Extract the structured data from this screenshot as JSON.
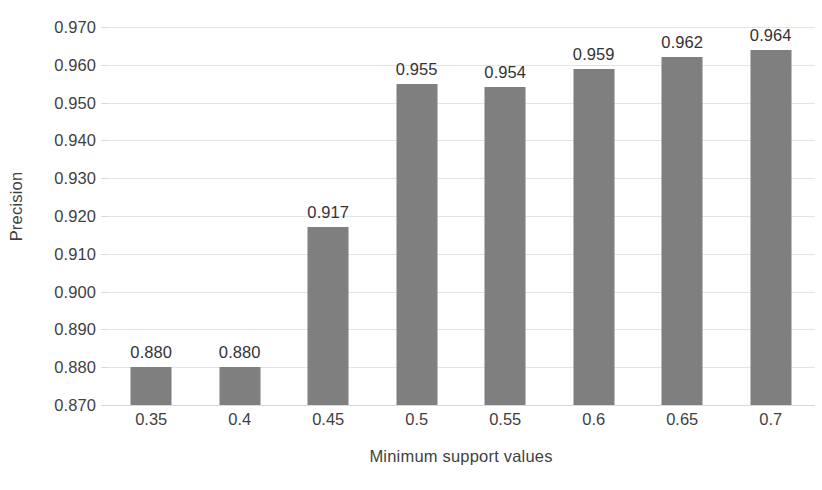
{
  "chart_data": {
    "type": "bar",
    "title": "",
    "xlabel": "Minimum support values",
    "ylabel": "Precision",
    "categories": [
      "0.35",
      "0.4",
      "0.45",
      "0.5",
      "0.55",
      "0.6",
      "0.65",
      "0.7"
    ],
    "values": [
      0.88,
      0.88,
      0.917,
      0.955,
      0.954,
      0.959,
      0.962,
      0.964
    ],
    "data_labels": [
      "0.880",
      "0.880",
      "0.917",
      "0.955",
      "0.954",
      "0.959",
      "0.962",
      "0.964"
    ],
    "series": [
      {
        "name": "Precision",
        "values": [
          0.88,
          0.88,
          0.917,
          0.955,
          0.954,
          0.959,
          0.962,
          0.964
        ]
      }
    ],
    "ylim": [
      0.87,
      0.97
    ],
    "ytick_step": 0.01,
    "ytick_labels": [
      "0.970",
      "0.960",
      "0.950",
      "0.940",
      "0.930",
      "0.920",
      "0.910",
      "0.900",
      "0.890",
      "0.880",
      "0.870"
    ],
    "ytick_values": [
      0.97,
      0.96,
      0.95,
      0.94,
      0.93,
      0.92,
      0.91,
      0.9,
      0.89,
      0.88,
      0.87
    ],
    "grid": true,
    "legend": false,
    "legend_position": "none",
    "bar_color": "#7f7f7f",
    "gridline_color": "#e4e4e4",
    "axis_line_color": "#d8d8d8",
    "text_color": "#3f3f3f",
    "background_color": "#ffffff"
  }
}
